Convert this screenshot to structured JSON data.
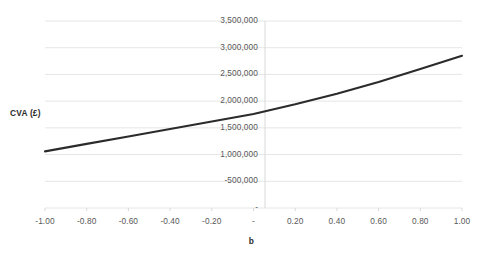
{
  "chart_data": {
    "type": "line",
    "title": "",
    "xlabel": "b",
    "ylabel": "CVA (£)",
    "xlim": [
      -1.0,
      1.0
    ],
    "ylim": [
      0,
      3500000
    ],
    "grid": true,
    "legend": false,
    "x_tick_labels": [
      "-1.00",
      "-0.80",
      "-0.60",
      "-0.40",
      "-0.20",
      "-",
      "0.20",
      "0.40",
      "0.60",
      "0.80",
      "1.00"
    ],
    "x_tick_values": [
      -1.0,
      -0.8,
      -0.6,
      -0.4,
      -0.2,
      0.0,
      0.2,
      0.4,
      0.6,
      0.8,
      1.0
    ],
    "y_tick_labels": [
      "3,500,000",
      "3,000,000",
      "2,500,000",
      "2,000,000",
      "1,500,000",
      "1,000,000",
      "-500,000",
      "-"
    ],
    "y_tick_values": [
      3500000,
      3000000,
      2500000,
      2000000,
      1500000,
      1000000,
      500000,
      0
    ],
    "series": [
      {
        "name": "CVA",
        "color": "#2b2b2b",
        "x": [
          -1.0,
          -0.8,
          -0.6,
          -0.4,
          -0.2,
          0.0,
          0.2,
          0.4,
          0.6,
          0.8,
          1.0
        ],
        "values": [
          1060000,
          1200000,
          1340000,
          1480000,
          1620000,
          1760000,
          1940000,
          2140000,
          2360000,
          2600000,
          2850000
        ]
      }
    ]
  },
  "axis_titles": {
    "y": "CVA (£)",
    "x": "b"
  },
  "colors": {
    "line": "#2b2b2b",
    "gridline": "#e6e6e6",
    "axis_line": "#d9d9d9",
    "tick_text": "#585858",
    "title_text": "#2b2b2b",
    "background": "#ffffff"
  }
}
